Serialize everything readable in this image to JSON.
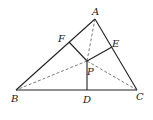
{
  "diagram": {
    "type": "geometry",
    "stroke_color": "#222222",
    "points": {
      "A": {
        "label": "A",
        "x": 95,
        "y": 19
      },
      "B": {
        "label": "B",
        "x": 16,
        "y": 90
      },
      "C": {
        "label": "C",
        "x": 137,
        "y": 90
      },
      "D": {
        "label": "D",
        "x": 87,
        "y": 90
      },
      "E": {
        "label": "E",
        "x": 112,
        "y": 47
      },
      "F": {
        "label": "F",
        "x": 69,
        "y": 42
      },
      "P": {
        "label": "P",
        "x": 87,
        "y": 61
      }
    },
    "solid_segments": [
      "AB",
      "BC",
      "CA",
      "PD",
      "PE",
      "PF"
    ],
    "dashed_segments": [
      "PA",
      "PB",
      "PC"
    ]
  }
}
